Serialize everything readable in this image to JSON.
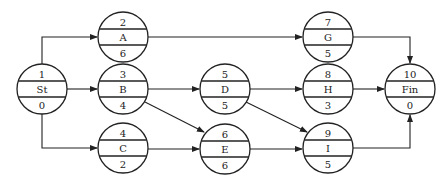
{
  "diagram": {
    "type": "precedence network (activity-on-node)",
    "nodes": [
      {
        "id": "St",
        "number": "1",
        "name": "St",
        "duration": "0",
        "cx": 42,
        "cy": 89
      },
      {
        "id": "A",
        "number": "2",
        "name": "A",
        "duration": "6",
        "cx": 123,
        "cy": 37
      },
      {
        "id": "B",
        "number": "3",
        "name": "B",
        "duration": "4",
        "cx": 123,
        "cy": 89
      },
      {
        "id": "C",
        "number": "4",
        "name": "C",
        "duration": "2",
        "cx": 123,
        "cy": 148
      },
      {
        "id": "D",
        "number": "5",
        "name": "D",
        "duration": "5",
        "cx": 225,
        "cy": 89
      },
      {
        "id": "E",
        "number": "6",
        "name": "E",
        "duration": "6",
        "cx": 225,
        "cy": 149
      },
      {
        "id": "G",
        "number": "7",
        "name": "G",
        "duration": "5",
        "cx": 328,
        "cy": 37
      },
      {
        "id": "H",
        "number": "8",
        "name": "H",
        "duration": "3",
        "cx": 328,
        "cy": 89
      },
      {
        "id": "I",
        "number": "9",
        "name": "I",
        "duration": "5",
        "cx": 328,
        "cy": 148
      },
      {
        "id": "Fin",
        "number": "10",
        "name": "Fin",
        "duration": "0",
        "cx": 410,
        "cy": 89
      }
    ],
    "edges": [
      {
        "from": "St",
        "to": "A"
      },
      {
        "from": "St",
        "to": "B"
      },
      {
        "from": "St",
        "to": "C"
      },
      {
        "from": "A",
        "to": "G"
      },
      {
        "from": "B",
        "to": "D"
      },
      {
        "from": "B",
        "to": "E"
      },
      {
        "from": "C",
        "to": "E"
      },
      {
        "from": "D",
        "to": "H"
      },
      {
        "from": "D",
        "to": "I"
      },
      {
        "from": "E",
        "to": "I"
      },
      {
        "from": "G",
        "to": "Fin"
      },
      {
        "from": "H",
        "to": "Fin"
      },
      {
        "from": "I",
        "to": "Fin"
      }
    ]
  }
}
